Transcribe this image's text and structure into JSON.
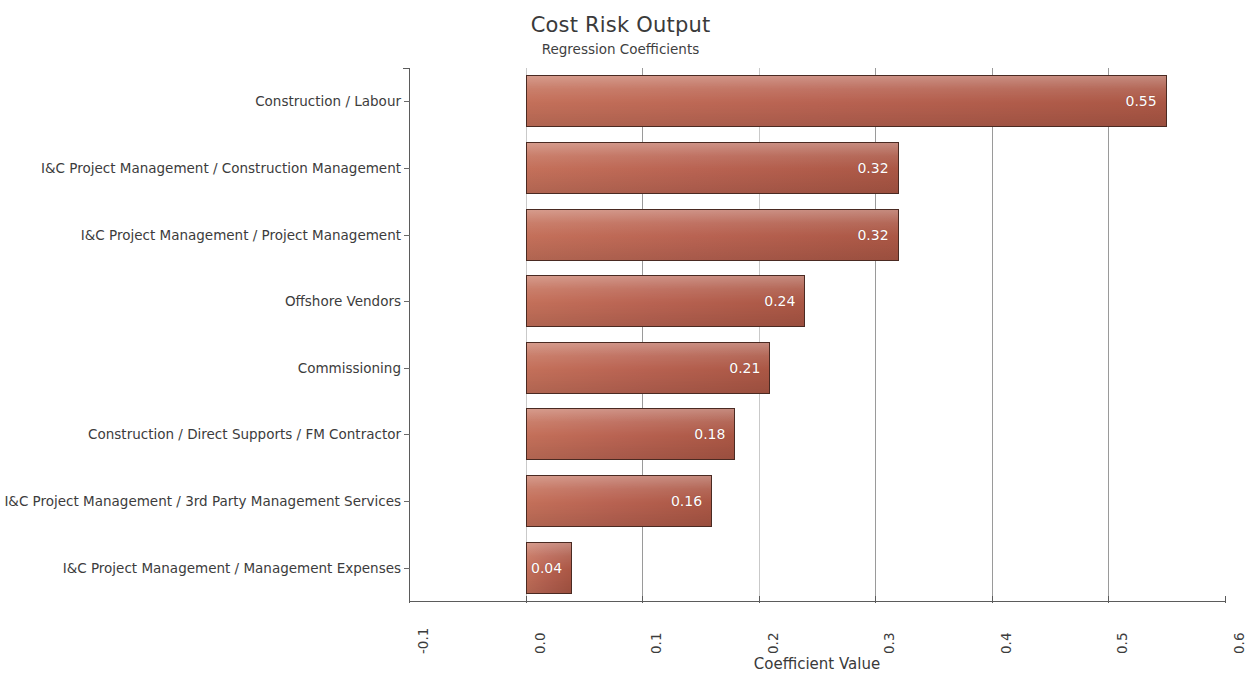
{
  "chart_data": {
    "type": "bar",
    "orientation": "horizontal",
    "title": "Cost Risk Output",
    "subtitle": "Regression Coefficients",
    "xlabel": "Coefficient Value",
    "ylabel": "",
    "xlim": [
      -0.1,
      0.6
    ],
    "xticks": [
      "-0.1",
      "0.0",
      "0.1",
      "0.2",
      "0.3",
      "0.4",
      "0.5",
      "0.6"
    ],
    "xtick_values": [
      -0.1,
      0.0,
      0.1,
      0.2,
      0.3,
      0.4,
      0.5,
      0.6
    ],
    "grid": "vertical",
    "legend": "none",
    "bar_color": "#b96352",
    "bar_border_color": "#4a2a22",
    "label_color": "#ffffff",
    "categories": [
      "Construction / Labour",
      "I&C Project Management / Construction Management",
      "I&C Project Management / Project Management",
      "Offshore Vendors",
      "Commissioning",
      "Construction / Direct Supports / FM Contractor",
      "I&C Project Management / 3rd Party Management Services",
      "I&C Project Management / Management Expenses"
    ],
    "values": [
      0.55,
      0.32,
      0.32,
      0.24,
      0.21,
      0.18,
      0.16,
      0.04
    ],
    "value_labels": [
      "0.55",
      "0.32",
      "0.32",
      "0.24",
      "0.21",
      "0.18",
      "0.16",
      "0.04"
    ]
  }
}
